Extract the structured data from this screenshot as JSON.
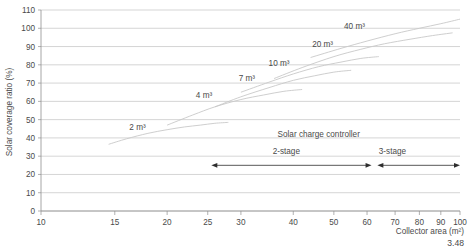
{
  "figure": {
    "number": "3.48"
  },
  "chart_data": {
    "type": "line",
    "title": "",
    "xlabel": "Collector area (m²)",
    "ylabel": "Solar coverage ratio (%)",
    "xscale": "log",
    "xlim": [
      10,
      100
    ],
    "ylim": [
      0,
      110
    ],
    "grid": true,
    "legend_position": "inline-curve-labels",
    "xticks": [
      10,
      15,
      20,
      25,
      30,
      40,
      50,
      60,
      70,
      80,
      90,
      100
    ],
    "xtick_labels": [
      "10",
      "15",
      "20",
      "25",
      "30",
      "40",
      "50",
      "60",
      "70",
      "80",
      "90",
      "100"
    ],
    "yticks": [
      0,
      10,
      20,
      30,
      40,
      50,
      60,
      70,
      80,
      90,
      100,
      110
    ],
    "ytick_labels": [
      "0",
      "10",
      "20",
      "30",
      "40",
      "50",
      "60",
      "70",
      "80",
      "90",
      "100",
      "110"
    ],
    "series": [
      {
        "name": "2 m³",
        "label": "2 m³",
        "label_x": 17.0,
        "label_y": 44.5,
        "x": [
          14.5,
          16,
          18,
          20,
          22,
          24,
          26,
          28
        ],
        "values": [
          36.5,
          39.5,
          42.5,
          44.5,
          46.0,
          47.0,
          48.0,
          48.5
        ]
      },
      {
        "name": "4 m³",
        "label": "4 m³",
        "label_x": 24.5,
        "label_y": 62.0,
        "x": [
          20,
          23,
          26,
          30,
          34,
          38,
          42
        ],
        "values": [
          47.0,
          52.5,
          57.0,
          61.0,
          63.5,
          65.5,
          66.5
        ]
      },
      {
        "name": "7 m³",
        "label": "7 m³",
        "label_x": 31.0,
        "label_y": 71.0,
        "x": [
          26,
          30,
          35,
          40,
          45,
          50,
          55
        ],
        "values": [
          57.0,
          62.5,
          67.5,
          71.5,
          74.0,
          76.0,
          77.0
        ]
      },
      {
        "name": "10 m³",
        "label": "10 m³",
        "label_x": 37.0,
        "label_y": 79.5,
        "x": [
          30,
          35,
          40,
          46,
          52,
          58,
          64
        ],
        "values": [
          65.0,
          70.5,
          75.0,
          79.0,
          81.5,
          83.5,
          84.5
        ]
      },
      {
        "name": "20 m³",
        "label": "20 m³",
        "label_x": 47.0,
        "label_y": 90.0,
        "x": [
          36,
          42,
          50,
          58,
          66,
          76,
          86,
          96
        ],
        "values": [
          72.5,
          78.5,
          84.5,
          88.5,
          91.5,
          94.0,
          96.0,
          97.5
        ]
      },
      {
        "name": "40 m³",
        "label": "40 m³",
        "label_x": 56.0,
        "label_y": 99.5,
        "x": [
          44,
          52,
          60,
          70,
          80,
          90,
          100
        ],
        "values": [
          84.0,
          89.0,
          93.0,
          97.0,
          100.0,
          102.5,
          105.0
        ]
      }
    ],
    "annotations": [
      {
        "name": "solar-charge-controller",
        "text": "Solar charge controller",
        "x": 46.0,
        "y": 40.5
      },
      {
        "name": "two-stage",
        "text": "2-stage",
        "x": 38.5,
        "y": 31.0
      },
      {
        "name": "three-stage",
        "text": "3-stage",
        "x": 69.0,
        "y": 31.0
      }
    ],
    "range_bars": [
      {
        "name": "two-stage-range",
        "label": "2-stage",
        "x_start": 25.5,
        "x_end": 61.5,
        "y": 25.0
      },
      {
        "name": "three-stage-range",
        "label": "3-stage",
        "x_start": 63.5,
        "x_end": 100.0,
        "y": 25.0
      }
    ]
  }
}
